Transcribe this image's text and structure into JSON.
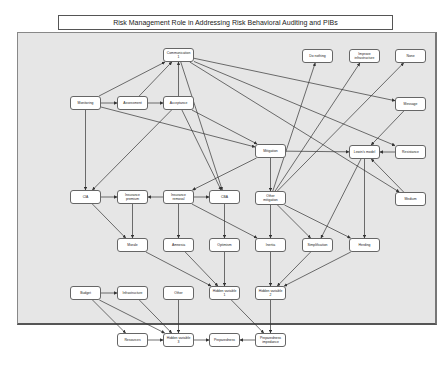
{
  "title": "Risk Management Role in Addressing Risk Behavioral Auditing and PIBs",
  "nodes": [
    {
      "id": "communication",
      "label": "Communication\n1",
      "x": 163,
      "y": 48,
      "w": 31,
      "h": 14
    },
    {
      "id": "do_nothing",
      "label": "Do nothing",
      "x": 302,
      "y": 49,
      "w": 31,
      "h": 14
    },
    {
      "id": "improve_infra",
      "label": "Improve\ninfrastructure",
      "x": 349,
      "y": 49,
      "w": 31,
      "h": 14
    },
    {
      "id": "none",
      "label": "None",
      "x": 395,
      "y": 49,
      "w": 31,
      "h": 14
    },
    {
      "id": "monitoring",
      "label": "Monitoring",
      "x": 70,
      "y": 96,
      "w": 31,
      "h": 14
    },
    {
      "id": "assessment",
      "label": "Assessment",
      "x": 117,
      "y": 96,
      "w": 31,
      "h": 14
    },
    {
      "id": "acceptance",
      "label": "Acceptance",
      "x": 163,
      "y": 96,
      "w": 31,
      "h": 14
    },
    {
      "id": "message",
      "label": "Message",
      "x": 395,
      "y": 97,
      "w": 31,
      "h": 14
    },
    {
      "id": "mitigation",
      "label": "Mitigation",
      "x": 255,
      "y": 144,
      "w": 31,
      "h": 14
    },
    {
      "id": "lewin",
      "label": "Lewin's model",
      "x": 349,
      "y": 145,
      "w": 31,
      "h": 14
    },
    {
      "id": "resistance",
      "label": "Resistance",
      "x": 395,
      "y": 145,
      "w": 31,
      "h": 14
    },
    {
      "id": "cia",
      "label": "CIA",
      "x": 70,
      "y": 190,
      "w": 31,
      "h": 14
    },
    {
      "id": "ins_premium",
      "label": "Insurance\npremium",
      "x": 117,
      "y": 190,
      "w": 31,
      "h": 14
    },
    {
      "id": "ins_removal",
      "label": "Insurance\nremoval",
      "x": 163,
      "y": 190,
      "w": 31,
      "h": 14
    },
    {
      "id": "cba",
      "label": "CBA",
      "x": 209,
      "y": 190,
      "w": 31,
      "h": 14
    },
    {
      "id": "other_mitigation",
      "label": "Other\nmitigation",
      "x": 255,
      "y": 191,
      "w": 31,
      "h": 14
    },
    {
      "id": "medium",
      "label": "Medium",
      "x": 395,
      "y": 192,
      "w": 31,
      "h": 14
    },
    {
      "id": "morale",
      "label": "Morale",
      "x": 117,
      "y": 238,
      "w": 31,
      "h": 14
    },
    {
      "id": "amnesia",
      "label": "Amnesia",
      "x": 163,
      "y": 238,
      "w": 31,
      "h": 14
    },
    {
      "id": "optimism",
      "label": "Optimism",
      "x": 209,
      "y": 238,
      "w": 31,
      "h": 14
    },
    {
      "id": "inertia",
      "label": "Inertia",
      "x": 255,
      "y": 238,
      "w": 31,
      "h": 14
    },
    {
      "id": "simplification",
      "label": "Simplification",
      "x": 302,
      "y": 238,
      "w": 31,
      "h": 14
    },
    {
      "id": "herding",
      "label": "Herding",
      "x": 349,
      "y": 238,
      "w": 31,
      "h": 14
    },
    {
      "id": "budget",
      "label": "Budget",
      "x": 70,
      "y": 286,
      "w": 31,
      "h": 14
    },
    {
      "id": "infrastructure",
      "label": "Infrastructure",
      "x": 117,
      "y": 286,
      "w": 31,
      "h": 14
    },
    {
      "id": "other",
      "label": "Other",
      "x": 163,
      "y": 286,
      "w": 31,
      "h": 14
    },
    {
      "id": "hidden1",
      "label": "Hidden variable\n1",
      "x": 209,
      "y": 286,
      "w": 31,
      "h": 14
    },
    {
      "id": "hidden2",
      "label": "Hidden variable\n2",
      "x": 255,
      "y": 286,
      "w": 31,
      "h": 14
    },
    {
      "id": "resources",
      "label": "Resources",
      "x": 117,
      "y": 333,
      "w": 31,
      "h": 14
    },
    {
      "id": "hidden3",
      "label": "Hidden variable\n3",
      "x": 163,
      "y": 333,
      "w": 31,
      "h": 14
    },
    {
      "id": "preparedness",
      "label": "Preparedness",
      "x": 209,
      "y": 333,
      "w": 31,
      "h": 14
    },
    {
      "id": "prep_impedance",
      "label": "Preparedness\nimpedance",
      "x": 255,
      "y": 333,
      "w": 31,
      "h": 14
    }
  ],
  "edges": [
    [
      "monitoring",
      "assessment"
    ],
    [
      "assessment",
      "acceptance"
    ],
    [
      "monitoring",
      "communication"
    ],
    [
      "assessment",
      "communication"
    ],
    [
      "acceptance",
      "communication"
    ],
    [
      "monitoring",
      "mitigation"
    ],
    [
      "acceptance",
      "mitigation"
    ],
    [
      "monitoring",
      "cia"
    ],
    [
      "acceptance",
      "cia"
    ],
    [
      "communication",
      "message"
    ],
    [
      "communication",
      "resistance"
    ],
    [
      "communication",
      "medium"
    ],
    [
      "communication",
      "cba"
    ],
    [
      "acceptance",
      "cba"
    ],
    [
      "mitigation",
      "lewin"
    ],
    [
      "mitigation",
      "other_mitigation"
    ],
    [
      "mitigation",
      "ins_removal"
    ],
    [
      "other_mitigation",
      "do_nothing"
    ],
    [
      "other_mitigation",
      "improve_infra"
    ],
    [
      "other_mitigation",
      "none"
    ],
    [
      "message",
      "lewin"
    ],
    [
      "resistance",
      "lewin"
    ],
    [
      "medium",
      "lewin"
    ],
    [
      "lewin",
      "simplification"
    ],
    [
      "lewin",
      "herding"
    ],
    [
      "cia",
      "ins_premium"
    ],
    [
      "ins_removal",
      "ins_premium"
    ],
    [
      "ins_removal",
      "cba"
    ],
    [
      "cia",
      "morale"
    ],
    [
      "ins_premium",
      "morale"
    ],
    [
      "ins_removal",
      "amnesia"
    ],
    [
      "cba",
      "optimism"
    ],
    [
      "ins_removal",
      "inertia"
    ],
    [
      "other_mitigation",
      "inertia"
    ],
    [
      "other_mitigation",
      "simplification"
    ],
    [
      "other_mitigation",
      "herding"
    ],
    [
      "morale",
      "hidden1"
    ],
    [
      "amnesia",
      "hidden1"
    ],
    [
      "optimism",
      "hidden1"
    ],
    [
      "inertia",
      "hidden2"
    ],
    [
      "simplification",
      "hidden2"
    ],
    [
      "herding",
      "hidden2"
    ],
    [
      "budget",
      "infrastructure"
    ],
    [
      "budget",
      "resources"
    ],
    [
      "budget",
      "hidden3"
    ],
    [
      "infrastructure",
      "hidden3"
    ],
    [
      "other",
      "hidden3"
    ],
    [
      "resources",
      "hidden3"
    ],
    [
      "hidden3",
      "preparedness"
    ],
    [
      "prep_impedance",
      "preparedness"
    ],
    [
      "hidden1",
      "prep_impedance"
    ],
    [
      "hidden2",
      "prep_impedance"
    ]
  ]
}
